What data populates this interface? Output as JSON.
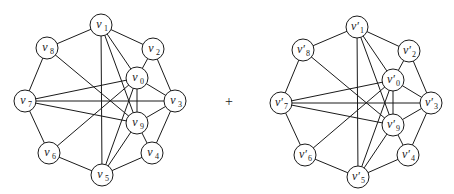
{
  "diagram": {
    "type": "graph-sum",
    "operator": "+",
    "graphs": [
      {
        "id": "left",
        "prime": false,
        "nodes": [
          "v0",
          "v1",
          "v2",
          "v3",
          "v4",
          "v5",
          "v6",
          "v7",
          "v8",
          "v9"
        ],
        "labels": {
          "v0": {
            "base": "v",
            "sub": "0"
          },
          "v1": {
            "base": "v",
            "sub": "1"
          },
          "v2": {
            "base": "v",
            "sub": "2"
          },
          "v3": {
            "base": "v",
            "sub": "3"
          },
          "v4": {
            "base": "v",
            "sub": "4"
          },
          "v5": {
            "base": "v",
            "sub": "5"
          },
          "v6": {
            "base": "v",
            "sub": "6"
          },
          "v7": {
            "base": "v",
            "sub": "7"
          },
          "v8": {
            "base": "v",
            "sub": "8"
          },
          "v9": {
            "base": "v",
            "sub": "9"
          }
        },
        "edges": [
          [
            "v1",
            "v2"
          ],
          [
            "v2",
            "v3"
          ],
          [
            "v3",
            "v4"
          ],
          [
            "v4",
            "v5"
          ],
          [
            "v5",
            "v6"
          ],
          [
            "v6",
            "v7"
          ],
          [
            "v7",
            "v8"
          ],
          [
            "v8",
            "v1"
          ],
          [
            "v1",
            "v5"
          ],
          [
            "v1",
            "v0"
          ],
          [
            "v1",
            "v9"
          ],
          [
            "v2",
            "v0"
          ],
          [
            "v0",
            "v3"
          ],
          [
            "v0",
            "v9"
          ],
          [
            "v0",
            "v7"
          ],
          [
            "v0",
            "v6"
          ],
          [
            "v0",
            "v5"
          ],
          [
            "v9",
            "v3"
          ],
          [
            "v9",
            "v4"
          ],
          [
            "v9",
            "v5"
          ],
          [
            "v9",
            "v7"
          ],
          [
            "v9",
            "v8"
          ],
          [
            "v7",
            "v3"
          ]
        ]
      },
      {
        "id": "right",
        "prime": true,
        "nodes": [
          "v0",
          "v1",
          "v2",
          "v3",
          "v4",
          "v5",
          "v6",
          "v7",
          "v8",
          "v9"
        ],
        "labels": {
          "v0": {
            "base": "v′",
            "sub": "0"
          },
          "v1": {
            "base": "v′",
            "sub": "1"
          },
          "v2": {
            "base": "v′",
            "sub": "2"
          },
          "v3": {
            "base": "v′",
            "sub": "3"
          },
          "v4": {
            "base": "v′",
            "sub": "4"
          },
          "v5": {
            "base": "v′",
            "sub": "5"
          },
          "v6": {
            "base": "v′",
            "sub": "6"
          },
          "v7": {
            "base": "v′",
            "sub": "7"
          },
          "v8": {
            "base": "v′",
            "sub": "8"
          },
          "v9": {
            "base": "v′",
            "sub": "9"
          }
        },
        "edges": [
          [
            "v1",
            "v2"
          ],
          [
            "v2",
            "v3"
          ],
          [
            "v3",
            "v4"
          ],
          [
            "v4",
            "v5"
          ],
          [
            "v5",
            "v6"
          ],
          [
            "v6",
            "v7"
          ],
          [
            "v7",
            "v8"
          ],
          [
            "v8",
            "v1"
          ],
          [
            "v1",
            "v5"
          ],
          [
            "v1",
            "v0"
          ],
          [
            "v1",
            "v9"
          ],
          [
            "v2",
            "v0"
          ],
          [
            "v0",
            "v3"
          ],
          [
            "v0",
            "v9"
          ],
          [
            "v0",
            "v7"
          ],
          [
            "v0",
            "v6"
          ],
          [
            "v0",
            "v5"
          ],
          [
            "v9",
            "v3"
          ],
          [
            "v9",
            "v4"
          ],
          [
            "v9",
            "v5"
          ],
          [
            "v9",
            "v7"
          ],
          [
            "v9",
            "v8"
          ],
          [
            "v7",
            "v3"
          ]
        ]
      }
    ]
  }
}
